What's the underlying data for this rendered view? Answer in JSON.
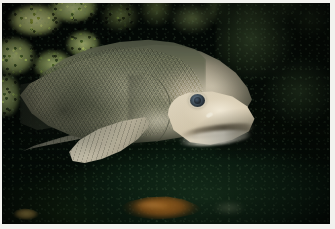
{
  "image": {
    "kind": "photograph",
    "medium": "underwater photography",
    "orientation": "landscape",
    "width_px": 335,
    "height_px": 229,
    "border": {
      "present": true,
      "color": "#f2f2ee",
      "description": "thin white photographic border on all four edges"
    }
  },
  "scene": {
    "setting": "dark underwater rocky reef",
    "lighting": "single artificial strobe from upper left; background falls off to near black",
    "water_tone": "deep green-black",
    "depth_cue": "subject brightly lit against unlit background"
  },
  "subject": {
    "name": "large gray fish",
    "common_identification": "deep-bodied reef fish (grouper / tilefish type)",
    "view": "left lateral profile",
    "facing": "right",
    "position": "center-left, occupying most of the frame",
    "body_color": "#8e8d78",
    "dorsal_color": "#4a5040",
    "belly_color": "#c9c1a9",
    "snout_color": "#e6ddc8",
    "features": [
      {
        "name": "eye",
        "description": "small round eye with dark blue-gray iris and black pupil, pale ring around it",
        "color": "#43525e"
      },
      {
        "name": "snout-and-jaw",
        "description": "blunt pale cream snout with thick lips and a downturned mouth line",
        "color": "#e6ddc8"
      },
      {
        "name": "scales",
        "description": "fine diagonal crosshatch scale texture across the flank",
        "color": "#74765f"
      },
      {
        "name": "gill-cover",
        "description": "operculum seam arcing down behind the head",
        "color": "#4e5243"
      },
      {
        "name": "pectoral-fin",
        "description": "pale fan-shaped fin with visible rays, lower mid-body",
        "color": "#ddd7c3"
      },
      {
        "name": "pelvic-fin",
        "description": "long slender dark fin sweeping back and to the left",
        "color": "#a8a492"
      }
    ]
  },
  "background_elements": [
    {
      "name": "algae-coral-upper-left",
      "description": "bright yellow-green encrusting algae and coral on rock",
      "color": "#9fae6e",
      "region": "upper-left corner"
    },
    {
      "name": "reef-top",
      "description": "dark mottled green reef growth along the top edge",
      "color": "#4e5c30",
      "region": "top band"
    },
    {
      "name": "reef-right-shadow",
      "description": "unlit rock face falling into black",
      "color": "#1d2c1a",
      "region": "right side"
    },
    {
      "name": "substrate",
      "description": "murky dark green bottom / silt",
      "color": "#16301c",
      "region": "lower half"
    }
  ],
  "secondary_subjects": [
    {
      "name": "orange-fish",
      "description": "small orange-brown fish resting on the bottom",
      "color": "#c57b28",
      "position": "bottom center"
    },
    {
      "name": "yellow-fish",
      "description": "small pale yellow fish, partly cut off",
      "color": "#b9a055",
      "position": "bottom-left corner"
    }
  ],
  "palette": {
    "darkest": "#030805",
    "water_green": "#0b1d11",
    "algae_light": "#c9cf8e",
    "algae_mid": "#76854a",
    "fish_body": "#8e8d78",
    "fish_dorsal": "#4a5040",
    "fish_snout": "#e6ddc8",
    "eye_iris": "#43525e",
    "orange_fish": "#c57b28",
    "border_white": "#f2f2ee"
  }
}
